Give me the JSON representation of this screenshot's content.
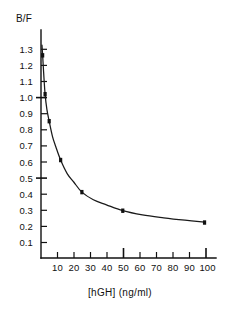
{
  "chart_data": {
    "type": "scatter",
    "title": "",
    "ylabel": "B/F",
    "xlabel": "[hGH] (ng/ml)",
    "xlim": [
      0,
      107
    ],
    "ylim": [
      0,
      1.35
    ],
    "grid": false,
    "legend": "none",
    "marker_style": "filled-square",
    "line_style": "smooth-curve",
    "x_ticks": [
      10,
      20,
      30,
      40,
      50,
      60,
      70,
      80,
      90,
      100
    ],
    "x_tick_labels": [
      "10",
      "20",
      "30",
      "40",
      "50",
      "60",
      "70",
      "80",
      "90",
      "100"
    ],
    "x_major_ticks": [
      50,
      100
    ],
    "y_ticks": [
      0.1,
      0.2,
      0.3,
      0.4,
      0.5,
      0.6,
      0.7,
      0.8,
      0.9,
      1.0,
      1.1,
      1.2,
      1.3
    ],
    "y_tick_labels": [
      "0.1",
      "0.2",
      "0.3",
      "0.4",
      "0.5",
      "0.6",
      "0.7",
      "0.8",
      "0.9",
      "1.0",
      "1.1",
      "1.2",
      "1.3"
    ],
    "y_major_ticks": [
      0.5,
      1.0
    ],
    "series": [
      {
        "name": "B/F binding",
        "x": [
          1.0,
          2.5,
          5.0,
          12.0,
          25.0,
          50.0,
          100.0
        ],
        "values": [
          1.2,
          0.97,
          0.81,
          0.58,
          0.39,
          0.28,
          0.21
        ]
      }
    ],
    "curve_x": [
      0.6,
      1.0,
      1.6,
      2.5,
      3.6,
      5.0,
      7.0,
      9.0,
      12.0,
      16.0,
      20.0,
      25.0,
      32.0,
      40.0,
      50.0,
      62.0,
      75.0,
      88.0,
      100.0
    ],
    "curve_y": [
      1.26,
      1.2,
      1.1,
      0.97,
      0.88,
      0.81,
      0.72,
      0.66,
      0.58,
      0.5,
      0.45,
      0.39,
      0.345,
      0.315,
      0.28,
      0.255,
      0.238,
      0.224,
      0.213
    ]
  },
  "axis": {
    "y_axis_title": "B/F",
    "x_axis_title": "[hGH] (ng/ml)"
  }
}
